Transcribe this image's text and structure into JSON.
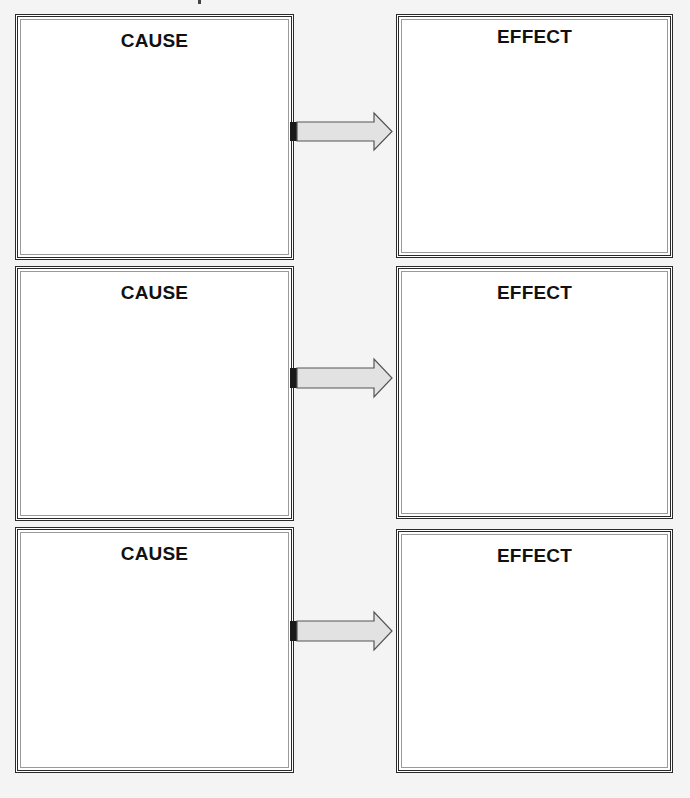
{
  "rows": [
    {
      "cause_label": "CAUSE",
      "effect_label": "EFFECT"
    },
    {
      "cause_label": "CAUSE",
      "effect_label": "EFFECT"
    },
    {
      "cause_label": "CAUSE",
      "effect_label": "EFFECT"
    }
  ],
  "colors": {
    "border": "#2a2a2a",
    "arrow_fill": "#e2e2e2",
    "arrow_stroke": "#555555",
    "background": "#f4f4f4"
  }
}
